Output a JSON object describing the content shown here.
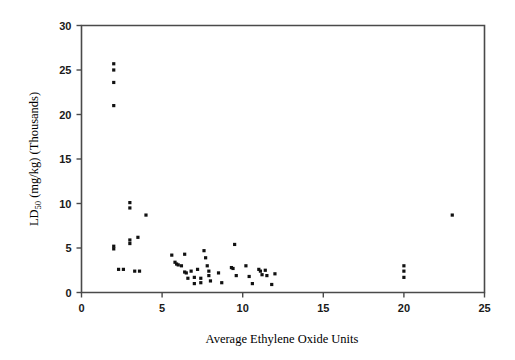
{
  "chart_data": {
    "type": "scatter",
    "title": "",
    "xlabel": "Average Ethylene Oxide Units",
    "ylabel": "LD50 (mg/kg) (Thousands)",
    "ylabel_main": "LD",
    "ylabel_sub": "50",
    "ylabel_rest": " (mg/kg) (Thousands)",
    "xlim": [
      0,
      25
    ],
    "ylim": [
      0,
      30
    ],
    "xticks": [
      0,
      5,
      10,
      15,
      20,
      25
    ],
    "yticks": [
      0,
      5,
      10,
      15,
      20,
      25,
      30
    ],
    "xtick_labels": [
      "0",
      "5",
      "10",
      "15",
      "20",
      "25"
    ],
    "ytick_labels": [
      "0",
      "5",
      "10",
      "15",
      "20",
      "25",
      "30"
    ],
    "grid": false,
    "legend": "none",
    "marker": "square",
    "marker_color": "#111111",
    "marker_size": 3.2,
    "n_points": 57,
    "points": [
      [
        2.0,
        25.7
      ],
      [
        2.0,
        25.0
      ],
      [
        2.0,
        23.6
      ],
      [
        2.0,
        21.0
      ],
      [
        2.0,
        5.2
      ],
      [
        2.0,
        4.9
      ],
      [
        2.3,
        2.6
      ],
      [
        2.6,
        2.6
      ],
      [
        3.0,
        10.1
      ],
      [
        3.0,
        9.5
      ],
      [
        3.0,
        5.9
      ],
      [
        3.0,
        5.5
      ],
      [
        3.3,
        2.4
      ],
      [
        3.5,
        6.2
      ],
      [
        3.6,
        2.4
      ],
      [
        4.0,
        8.7
      ],
      [
        5.6,
        4.2
      ],
      [
        5.8,
        3.4
      ],
      [
        5.9,
        3.2
      ],
      [
        6.0,
        3.1
      ],
      [
        6.2,
        3.0
      ],
      [
        6.4,
        4.3
      ],
      [
        6.4,
        2.3
      ],
      [
        6.5,
        2.2
      ],
      [
        6.6,
        1.6
      ],
      [
        6.8,
        2.4
      ],
      [
        7.0,
        1.7
      ],
      [
        7.0,
        1.0
      ],
      [
        7.2,
        2.6
      ],
      [
        7.4,
        1.6
      ],
      [
        7.4,
        1.1
      ],
      [
        7.6,
        4.7
      ],
      [
        7.7,
        3.9
      ],
      [
        7.8,
        3.0
      ],
      [
        7.9,
        2.4
      ],
      [
        7.9,
        1.9
      ],
      [
        8.0,
        1.3
      ],
      [
        8.5,
        2.2
      ],
      [
        8.7,
        1.1
      ],
      [
        9.3,
        2.8
      ],
      [
        9.4,
        2.7
      ],
      [
        9.5,
        5.4
      ],
      [
        9.6,
        1.9
      ],
      [
        10.2,
        3.0
      ],
      [
        10.4,
        1.8
      ],
      [
        10.6,
        1.0
      ],
      [
        11.0,
        2.6
      ],
      [
        11.1,
        2.4
      ],
      [
        11.2,
        2.0
      ],
      [
        11.4,
        2.5
      ],
      [
        11.5,
        1.9
      ],
      [
        11.8,
        0.9
      ],
      [
        12.0,
        2.1
      ],
      [
        20.0,
        3.0
      ],
      [
        20.0,
        2.4
      ],
      [
        20.0,
        1.7
      ],
      [
        23.0,
        8.7
      ]
    ]
  }
}
